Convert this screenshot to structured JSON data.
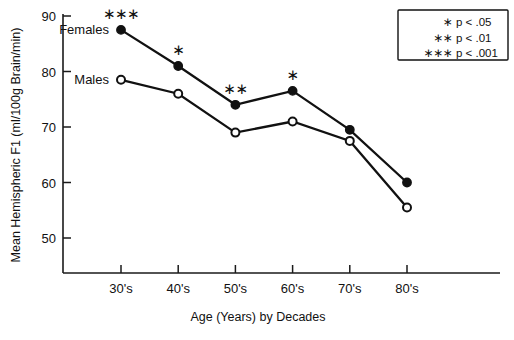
{
  "chart_data": {
    "type": "line",
    "title": "",
    "xlabel": "Age (Years) by Decades",
    "ylabel": "Mean Hemispheric F1  (ml/100g Brain/min)",
    "categories": [
      "30's",
      "40's",
      "50's",
      "60's",
      "70's",
      "80's"
    ],
    "xtick_labels": [
      "30's",
      "40's",
      "50's",
      "60's",
      "70's",
      "80's"
    ],
    "ytick_labels": [
      "50",
      "60",
      "70",
      "80",
      "90"
    ],
    "yticks": [
      50,
      60,
      70,
      80,
      90
    ],
    "ylim": [
      45,
      90
    ],
    "grid": false,
    "legend_position": "top-right",
    "series": [
      {
        "name": "Females",
        "marker": "filled-circle",
        "label_at": "30's",
        "values": [
          87.5,
          81.0,
          74.0,
          76.5,
          69.5,
          60.0
        ],
        "significance": [
          "***",
          "*",
          "**",
          "*",
          "",
          ""
        ]
      },
      {
        "name": "Males",
        "marker": "open-circle",
        "label_at": "30's",
        "values": [
          78.5,
          76.0,
          69.0,
          71.0,
          67.5,
          55.5
        ],
        "significance": [
          "",
          "",
          "",
          "",
          "",
          ""
        ]
      }
    ],
    "annotations": [
      {
        "text": "***",
        "category": "30's",
        "series": "Females"
      },
      {
        "text": "*",
        "category": "40's",
        "series": "Females"
      },
      {
        "text": "**",
        "category": "50's",
        "series": "Females"
      },
      {
        "text": "*",
        "category": "60's",
        "series": "Females"
      }
    ]
  },
  "legend": {
    "entries": [
      {
        "stars": "∗",
        "text": "p < .05"
      },
      {
        "stars": "∗∗",
        "text": "p < .01"
      },
      {
        "stars": "∗∗∗",
        "text": "p < .001"
      }
    ]
  },
  "colors": {
    "ink": "#111111",
    "background": "#ffffff",
    "marker_fill_females": "#111111",
    "marker_fill_males": "#ffffff"
  }
}
